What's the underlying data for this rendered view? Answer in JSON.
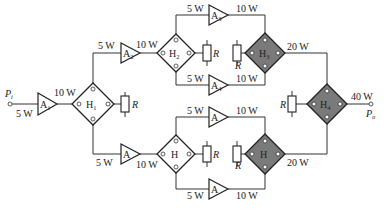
{
  "diagram": {
    "type": "power-combining amplifier network",
    "input": {
      "label": "P",
      "sub": "i",
      "power": "5 W"
    },
    "output": {
      "label": "P",
      "sub": "o",
      "power": "40 W"
    },
    "amplifiers": [
      {
        "id": "A1",
        "label": "A",
        "sub": "1",
        "in": "5 W",
        "out": "10 W"
      },
      {
        "id": "A2",
        "label": "A",
        "sub": "2",
        "in": "5 W",
        "out": "10 W"
      },
      {
        "id": "A3",
        "label": "A",
        "sub": "3",
        "in": "5 W",
        "out": "10 W"
      },
      {
        "id": "A4",
        "label": "A",
        "sub": "4",
        "in": "5 W",
        "out": "10 W"
      },
      {
        "id": "A-lower-mid",
        "label": "A",
        "sub": "",
        "in": "5 W",
        "out": "10 W"
      },
      {
        "id": "A-lower-top",
        "label": "A",
        "sub": "",
        "in": "5 W",
        "out": "10 W"
      },
      {
        "id": "A-lower-bottom",
        "label": "A",
        "sub": "",
        "in": "5 W",
        "out": "10 W"
      }
    ],
    "hybrids": [
      {
        "id": "H1",
        "label": "H",
        "sub": "1",
        "role": "splitter",
        "shaded": false
      },
      {
        "id": "H2",
        "label": "H",
        "sub": "2",
        "role": "splitter",
        "shaded": false
      },
      {
        "id": "H3",
        "label": "H",
        "sub": "3",
        "role": "combiner",
        "shaded": true,
        "out": "20 W"
      },
      {
        "id": "H4",
        "label": "H",
        "sub": "4",
        "role": "combiner",
        "shaded": true,
        "out": "40 W"
      },
      {
        "id": "H-lower-split",
        "label": "H",
        "sub": "",
        "role": "splitter",
        "shaded": false
      },
      {
        "id": "H-lower-comb",
        "label": "H",
        "sub": "",
        "role": "combiner",
        "shaded": true,
        "out": "20 W"
      }
    ],
    "resistor_label": "R",
    "labels": {
      "w5": "5 W",
      "w10": "10 W",
      "w20": "20 W",
      "w40": "40 W"
    }
  }
}
